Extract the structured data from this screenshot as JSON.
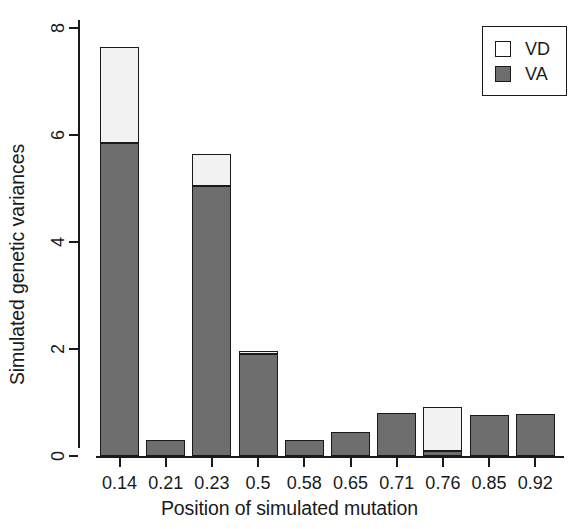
{
  "chart_data": {
    "type": "bar",
    "subtype": "stacked-bar",
    "title": "",
    "xlabel": "Position of simulated mutation",
    "ylabel": "Simulated genetic variances",
    "categories": [
      "0.14",
      "0.21",
      "0.23",
      "0.5",
      "0.58",
      "0.65",
      "0.71",
      "0.76",
      "0.85",
      "0.92"
    ],
    "series": [
      {
        "name": "VA",
        "color": "#6e6e6e",
        "values": [
          5.85,
          0.3,
          5.05,
          1.9,
          0.3,
          0.45,
          0.8,
          0.1,
          0.76,
          0.78
        ]
      },
      {
        "name": "VD",
        "color": "#ffffff",
        "values": [
          1.8,
          0.0,
          0.6,
          0.07,
          0.0,
          0.0,
          0.0,
          0.82,
          0.0,
          0.0
        ]
      }
    ],
    "totals": [
      7.65,
      0.3,
      5.65,
      1.97,
      0.3,
      0.45,
      0.8,
      0.92,
      0.76,
      0.78
    ],
    "ylim": [
      0,
      8
    ],
    "yticks": [
      "0",
      "2",
      "4",
      "6",
      "8"
    ],
    "ytick_values": [
      0,
      2,
      4,
      6,
      8
    ],
    "grid": false,
    "legend_position": "top-right",
    "legend": [
      {
        "label": "VD",
        "swatch": "open-square"
      },
      {
        "label": "VA",
        "swatch": "filled-square"
      }
    ]
  },
  "axes": {
    "y_title": "Simulated genetic variances",
    "x_title": "Position of simulated mutation"
  }
}
